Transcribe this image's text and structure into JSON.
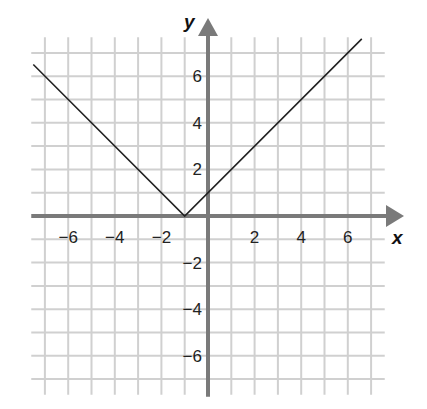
{
  "chart_data": {
    "type": "line",
    "title": "",
    "xlabel": "x",
    "ylabel": "y",
    "function": "y = |x + 1|",
    "xlim": [
      -7.5,
      7.5
    ],
    "ylim": [
      -7.5,
      7.5
    ],
    "grid": true,
    "grid_step": 1,
    "x_ticks": [
      -6,
      -4,
      -2,
      2,
      4,
      6
    ],
    "y_ticks": [
      -6,
      -4,
      -2,
      2,
      4,
      6
    ],
    "x_tick_labels": [
      "−6",
      "−4",
      "−2",
      "2",
      "4",
      "6"
    ],
    "y_tick_labels": [
      "−6",
      "−4",
      "−2",
      "2",
      "4",
      "6"
    ],
    "series": [
      {
        "name": "y = |x + 1|",
        "x": [
          -7.5,
          -1,
          6.6
        ],
        "y": [
          6.5,
          0,
          7.6
        ]
      }
    ],
    "vertex": {
      "x": -1,
      "y": 0
    },
    "colors": {
      "grid": "#d0d0d0",
      "axis": "#7a7a7a",
      "line": "#222222"
    }
  }
}
